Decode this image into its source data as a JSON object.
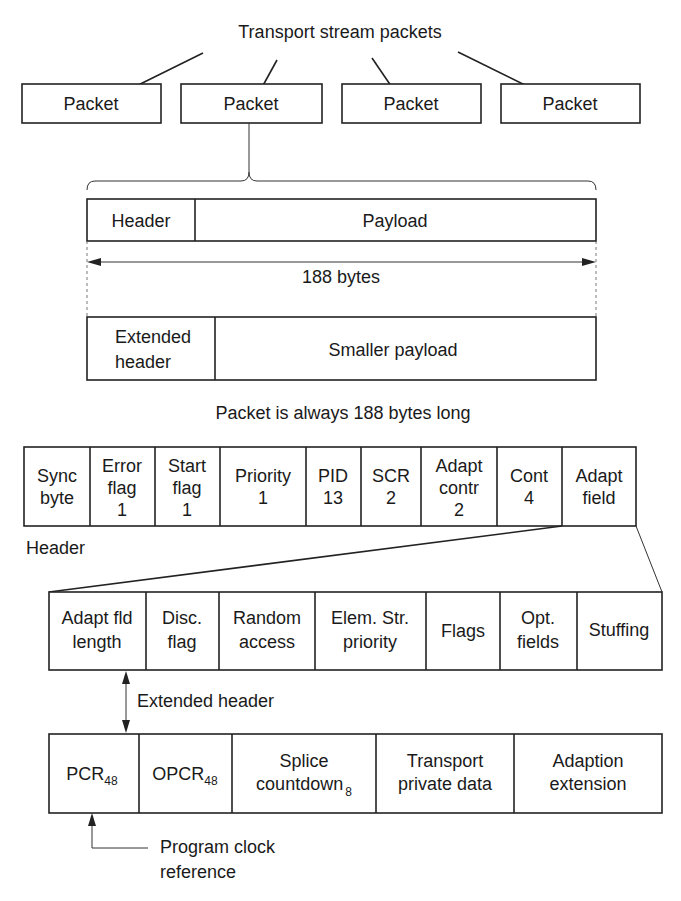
{
  "title": "Transport stream packets",
  "packets": [
    {
      "label": "Packet"
    },
    {
      "label": "Packet"
    },
    {
      "label": "Packet"
    },
    {
      "label": "Packet"
    }
  ],
  "packet_layout": {
    "row1": {
      "header": "Header",
      "payload": "Payload"
    },
    "size_label": "188 bytes",
    "row2": {
      "header_line1": "Extended",
      "header_line2": "header",
      "payload": "Smaller payload"
    },
    "caption": "Packet is always 188 bytes long"
  },
  "header_fields": [
    {
      "l1": "Sync",
      "l2": "byte",
      "l3": ""
    },
    {
      "l1": "Error",
      "l2": "flag",
      "l3": "1"
    },
    {
      "l1": "Start",
      "l2": "flag",
      "l3": "1"
    },
    {
      "l1": "Priority",
      "l2": "1",
      "l3": ""
    },
    {
      "l1": "PID",
      "l2": "13",
      "l3": ""
    },
    {
      "l1": "SCR",
      "l2": "2",
      "l3": ""
    },
    {
      "l1": "Adapt",
      "l2": "contr",
      "l3": "2"
    },
    {
      "l1": "Cont",
      "l2": "4",
      "l3": ""
    },
    {
      "l1": "Adapt",
      "l2": "field",
      "l3": ""
    }
  ],
  "header_label": "Header",
  "adapt_fields": [
    {
      "l1": "Adapt fld",
      "l2": "length"
    },
    {
      "l1": "Disc.",
      "l2": "flag"
    },
    {
      "l1": "Random",
      "l2": "access"
    },
    {
      "l1": "Elem. Str.",
      "l2": "priority"
    },
    {
      "l1": "Flags",
      "l2": ""
    },
    {
      "l1": "Opt.",
      "l2": "fields"
    },
    {
      "l1": "Stuffing",
      "l2": ""
    }
  ],
  "extended_header_label": "Extended header",
  "optional_fields": [
    {
      "l1": "PCR",
      "sub": "48",
      "l2": ""
    },
    {
      "l1": "OPCR",
      "sub": "48",
      "l2": ""
    },
    {
      "l1": "Splice",
      "l2": "countdown",
      "sub": "8"
    },
    {
      "l1": "Transport",
      "l2": "private data",
      "sub": ""
    },
    {
      "l1": "Adaption",
      "l2": "extension",
      "sub": ""
    }
  ],
  "pcr_note": {
    "line1": "Program clock",
    "line2": "reference"
  }
}
